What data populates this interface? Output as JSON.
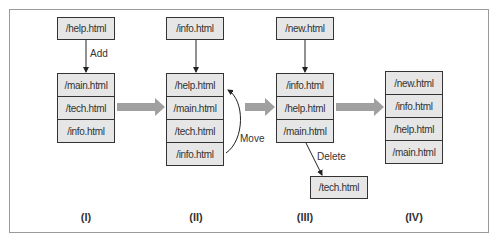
{
  "columns": [
    {
      "label": "(I)",
      "incoming": "/help.html",
      "operation": "Add",
      "stack": [
        "/main.html",
        "/tech.html",
        "/info.html"
      ]
    },
    {
      "label": "(II)",
      "incoming": "/info.html",
      "operation": "Move",
      "stack": [
        "/help.html",
        "/main.html",
        "/tech.html",
        "/info.html"
      ]
    },
    {
      "label": "(III)",
      "incoming": "/new.html",
      "operation": "Delete",
      "stack": [
        "/info.html",
        "/help.html",
        "/main.html"
      ],
      "removed": "/tech.html"
    },
    {
      "label": "(IV)",
      "stack": [
        "/new.html",
        "/info.html",
        "/help.html",
        "/main.html"
      ]
    }
  ],
  "colors": {
    "box_fill": "#e6e6e6",
    "border": "#333333",
    "flow_arrow": "#a0a0a0",
    "frame": "#9a9a9a"
  }
}
